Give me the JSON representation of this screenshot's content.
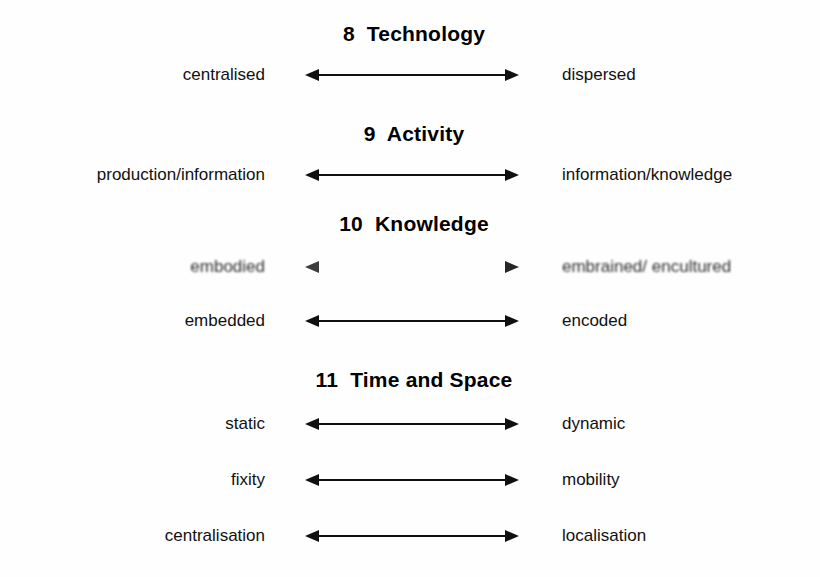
{
  "document": {
    "type": "scanned-diagram",
    "background_color": "#fefefe",
    "ink_color": "#000000"
  },
  "sections": [
    {
      "number": "8",
      "title": "Technology",
      "heading": "8  Technology",
      "rows": [
        {
          "left": "centralised",
          "right": "dispersed",
          "arrow": "double-headed-arrow",
          "degraded": false
        }
      ]
    },
    {
      "number": "9",
      "title": "Activity",
      "heading": "9  Activity",
      "rows": [
        {
          "left": "production/information",
          "right": "information/knowledge",
          "arrow": "double-headed-arrow",
          "degraded": false
        }
      ]
    },
    {
      "number": "10",
      "title": "Knowledge",
      "heading": "10  Knowledge",
      "rows": [
        {
          "left": "embodied",
          "right": "embrained/ encultured",
          "arrow": "double-headed-arrow",
          "degraded": true
        },
        {
          "left": "embedded",
          "right": "encoded",
          "arrow": "double-headed-arrow",
          "degraded": false
        }
      ]
    },
    {
      "number": "11",
      "title": "Time and Space",
      "heading": "11  Time and Space",
      "rows": [
        {
          "left": "static",
          "right": "dynamic",
          "arrow": "double-headed-arrow",
          "degraded": false
        },
        {
          "left": "fixity",
          "right": "mobility",
          "arrow": "double-headed-arrow",
          "degraded": false
        },
        {
          "left": "centralisation",
          "right": "localisation",
          "arrow": "double-headed-arrow",
          "degraded": false
        }
      ]
    }
  ]
}
